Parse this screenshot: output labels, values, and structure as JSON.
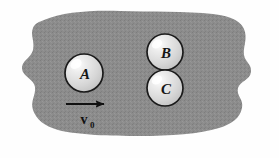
{
  "figure": {
    "type": "physics-collision-diagram",
    "caption": "",
    "background_color": "#fefefe",
    "blob": {
      "name": "surface-region",
      "fill_color": "#8c8c8c",
      "texture": "speckled-halftone"
    },
    "balls": [
      {
        "id": "A",
        "label": "A",
        "cx": 84,
        "cy": 73,
        "r": 19,
        "fill": "#d9d9d9",
        "stroke": "#1a1a1a"
      },
      {
        "id": "B",
        "label": "B",
        "cx": 165,
        "cy": 52,
        "r": 18,
        "fill": "#d9d9d9",
        "stroke": "#1a1a1a"
      },
      {
        "id": "C",
        "label": "C",
        "cx": 165,
        "cy": 88,
        "r": 18,
        "fill": "#d9d9d9",
        "stroke": "#1a1a1a"
      }
    ],
    "velocity_arrow": {
      "name": "velocity-vector",
      "label_base": "v",
      "label_subscript": "0",
      "x_start": 66,
      "x_end": 109,
      "y": 104,
      "direction": "right",
      "color": "#111111"
    }
  }
}
